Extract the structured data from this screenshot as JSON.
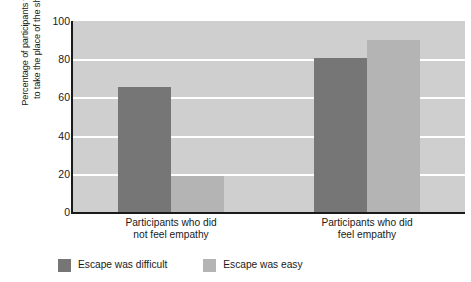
{
  "chart_data": {
    "type": "bar",
    "title": "",
    "subtitle": "",
    "xlabel": "",
    "ylabel": "Percentage of participants volunteering to take the place of the shock victim",
    "ylabel_lines": [
      "Percentage of participants volunteering",
      "to take the place of the shock victim"
    ],
    "categories": [
      "Participants who did not feel empathy",
      "Participants who did feel empathy"
    ],
    "category_lines": [
      [
        "Participants who did",
        "not feel empathy"
      ],
      [
        "Participants who did",
        "feel empathy"
      ]
    ],
    "series": [
      {
        "name": "Escape was difficult",
        "color": "#767676",
        "values": [
          65.5,
          80.5
        ]
      },
      {
        "name": "Escape was easy",
        "color": "#b4b4b4",
        "values": [
          19.0,
          90.0
        ]
      }
    ],
    "ylim": [
      0,
      100
    ],
    "yticks": [
      0,
      20,
      40,
      60,
      80,
      100
    ],
    "ytick_labels": [
      "0",
      "20",
      "40",
      "60",
      "80",
      "100"
    ],
    "grid": true,
    "grid_color": "#ffffff",
    "plot_background": "#cfcfcf",
    "legend_position": "bottom",
    "legend": [
      {
        "label": "Escape was difficult",
        "color": "#767676"
      },
      {
        "label": "Escape was easy",
        "color": "#b4b4b4"
      }
    ]
  }
}
